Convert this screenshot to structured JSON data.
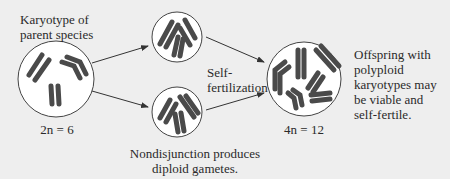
{
  "diagram": {
    "parent_label": "Karyotype of parent species",
    "parent_label_line1": "Karyotype of",
    "parent_label_line2": "parent species",
    "parent_ploidy": "2n = 6",
    "self_fert_line1": "Self-",
    "self_fert_line2": "fertilization",
    "nondisjunction_line1": "Nondisjunction produces",
    "nondisjunction_line2": "diploid gametes.",
    "offspring_ploidy": "4n = 12",
    "offspring_line1": "Offspring with",
    "offspring_line2": "polyploid",
    "offspring_line3": "karyotypes may",
    "offspring_line4": "be viable and",
    "offspring_line5": "self-fertile.",
    "colors": {
      "panel_bg": "#eeeeee",
      "circle_fill": "#ffffff",
      "chromosome": "#4a4a4a",
      "arrow": "#333333"
    }
  }
}
